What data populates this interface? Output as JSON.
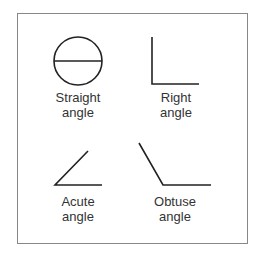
{
  "diagram": {
    "stroke_color": "#222222",
    "frame_color": "#888888",
    "items": [
      {
        "name": "straight",
        "label_line1": "Straight",
        "label_line2": "angle"
      },
      {
        "name": "right",
        "label_line1": "Right",
        "label_line2": "angle"
      },
      {
        "name": "acute",
        "label_line1": "Acute",
        "label_line2": "angle"
      },
      {
        "name": "obtuse",
        "label_line1": "Obtuse",
        "label_line2": "angle"
      }
    ]
  }
}
